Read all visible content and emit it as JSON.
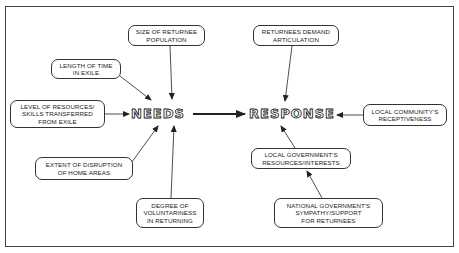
{
  "diagram": {
    "central_nodes": {
      "needs": "NEEDS",
      "response": "RESPONSE"
    },
    "needs_factors": [
      {
        "id": "size-of-returnee-population",
        "label": "SIZE OF RETURNEE\nPOPULATION"
      },
      {
        "id": "length-of-time-in-exile",
        "label": "LENGTH OF TIME\nIN EXILE"
      },
      {
        "id": "level-of-resources",
        "label": "LEVEL OF RESOURCES/\nSKILLS TRANSFERRED\nFROM EXILE"
      },
      {
        "id": "extent-of-disruption",
        "label": "EXTENT OF DISRUPTION\nOF HOME AREAS"
      },
      {
        "id": "degree-of-voluntariness",
        "label": "DEGREE OF\nVOLUNTARINESS\nIN RETURNING"
      }
    ],
    "response_factors": [
      {
        "id": "returnees-demand-articulation",
        "label": "RETURNEES DEMAND\nARTICULATION"
      },
      {
        "id": "local-community-receptiveness",
        "label": "LOCAL COMMUNITY'S\nRECEPTIVENESS"
      },
      {
        "id": "local-government-resources",
        "label": "LOCAL GOVERNMENT'S\nRESOURCES/INTERESTS"
      },
      {
        "id": "national-government-sympathy",
        "label": "NATIONAL GOVERNMENT'S\nSYMPATHY/SUPPORT\nFOR RETURNEES"
      }
    ],
    "edges": [
      {
        "from": "SIZE OF RETURNEE POPULATION",
        "to": "NEEDS"
      },
      {
        "from": "LENGTH OF TIME IN EXILE",
        "to": "NEEDS"
      },
      {
        "from": "LEVEL OF RESOURCES/SKILLS TRANSFERRED FROM EXILE",
        "to": "NEEDS"
      },
      {
        "from": "EXTENT OF DISRUPTION OF HOME AREAS",
        "to": "NEEDS"
      },
      {
        "from": "DEGREE OF VOLUNTARINESS IN RETURNING",
        "to": "NEEDS"
      },
      {
        "from": "NEEDS",
        "to": "RESPONSE"
      },
      {
        "from": "RETURNEES DEMAND ARTICULATION",
        "to": "RESPONSE"
      },
      {
        "from": "LOCAL COMMUNITY'S RECEPTIVENESS",
        "to": "RESPONSE"
      },
      {
        "from": "LOCAL GOVERNMENT'S RESOURCES/INTERESTS",
        "to": "RESPONSE"
      },
      {
        "from": "NATIONAL GOVERNMENT'S SYMPATHY/SUPPORT FOR RETURNEES",
        "to": "LOCAL GOVERNMENT'S RESOURCES/INTERESTS"
      }
    ]
  }
}
